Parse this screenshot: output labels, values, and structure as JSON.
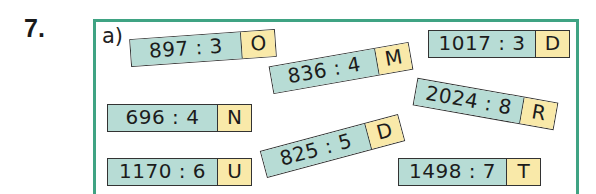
{
  "task": {
    "number": "7.",
    "part_label": "a)"
  },
  "colors": {
    "frame": "#3fa383",
    "expression_bg": "#b7dcd5",
    "letter_bg": "#f9e9a9",
    "border": "#333333"
  },
  "cards": [
    {
      "expression": "897 : 3",
      "letter": "O"
    },
    {
      "expression": "836 : 4",
      "letter": "M"
    },
    {
      "expression": "1017 : 3",
      "letter": "D"
    },
    {
      "expression": "696 : 4",
      "letter": "N"
    },
    {
      "expression": "2024 : 8",
      "letter": "R"
    },
    {
      "expression": "825 : 5",
      "letter": "D"
    },
    {
      "expression": "1170 : 6",
      "letter": "U"
    },
    {
      "expression": "1498 : 7",
      "letter": "T"
    }
  ]
}
